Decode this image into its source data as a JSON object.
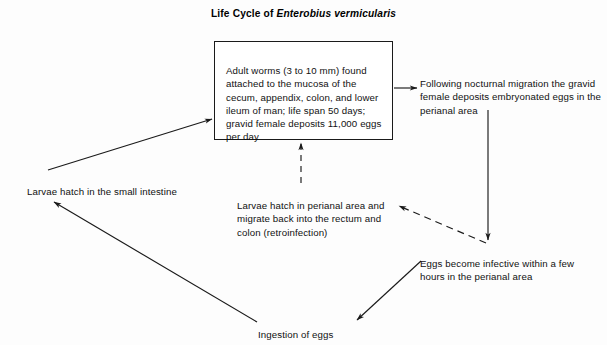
{
  "title": {
    "prefix": "Life Cycle of ",
    "species": "Enterobius vermicularis",
    "full": "Life Cycle of Enterobius vermicularis"
  },
  "colors": {
    "background": "#fdfdfd",
    "ink": "#111111",
    "box_border": "#1a1a1a",
    "edge": "#1a1a1a"
  },
  "nodes": {
    "adult_worms": {
      "text": "Adult worms (3 to 10 mm) found attached to the mucosa of the cecum, appendix, colon, and lower ileum of man; life span 50 days; gravid female deposits 11,000 eggs per day",
      "boxed": true
    },
    "nocturnal_migration": {
      "text": "Following nocturnal migration the gravid female deposits embryonated eggs in the perianal area",
      "boxed": false
    },
    "larvae_small_intestine": {
      "text": "Larvae hatch in the small intestine",
      "boxed": false
    },
    "larvae_perianal": {
      "text": "Larvae hatch in perianal area and migrate back into the rectum and colon (retroinfection)",
      "boxed": false
    },
    "eggs_infective": {
      "text": "Eggs become infective within a few hours in the perianal area",
      "boxed": false
    },
    "ingestion": {
      "text": "Ingestion of eggs",
      "boxed": false
    }
  },
  "edges": [
    {
      "id": "adult-to-migration",
      "from": "adult_worms",
      "to": "nocturnal_migration",
      "style": "solid",
      "direction": "right"
    },
    {
      "id": "migration-to-infective",
      "from": "nocturnal_migration",
      "to": "eggs_infective",
      "style": "solid",
      "direction": "down"
    },
    {
      "id": "infective-to-ingestion",
      "from": "eggs_infective",
      "to": "ingestion",
      "style": "solid",
      "direction": "down-left"
    },
    {
      "id": "ingestion-to-small-intestine",
      "from": "ingestion",
      "to": "larvae_small_intestine",
      "style": "solid",
      "direction": "up-left"
    },
    {
      "id": "small-intestine-to-adult",
      "from": "larvae_small_intestine",
      "to": "adult_worms",
      "style": "solid",
      "direction": "up-right"
    },
    {
      "id": "infective-to-larvae-perianal",
      "from": "eggs_infective",
      "to": "larvae_perianal",
      "style": "dashed",
      "direction": "up-left"
    },
    {
      "id": "larvae-perianal-to-adult",
      "from": "larvae_perianal",
      "to": "adult_worms",
      "style": "dashed",
      "direction": "up"
    }
  ]
}
